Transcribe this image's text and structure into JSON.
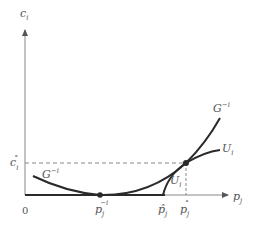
{
  "diagram": {
    "title": "",
    "axes": {
      "y_label": "c",
      "y_label_sub": "i",
      "x_label": "p",
      "x_label_sub": "j",
      "origin_label": "0"
    },
    "curves": [
      {
        "name": "G",
        "sup": "−i",
        "description": "cost curve G^{-i}, U-shaped with minimum at p_j^{-i}"
      },
      {
        "name": "U",
        "sub": "i",
        "description": "curve U_i rising from p-hat_j, crossing G^{-i} at (p_j°, c_i°)"
      }
    ],
    "labels": {
      "g_left": {
        "base": "G",
        "sup": "−i"
      },
      "g_right": {
        "base": "G",
        "sup": "−i"
      },
      "u_right": {
        "base": "U",
        "sub": "i"
      },
      "u_lower": {
        "base": "U",
        "sub": "i"
      },
      "c_star": {
        "base": "c",
        "sub": "i",
        "sup": "°"
      },
      "p_min": {
        "base": "p",
        "sub": "j",
        "sup": "−i"
      },
      "p_hat": {
        "base": "p̂",
        "sub": "j"
      },
      "p_star": {
        "base": "p",
        "sub": "j",
        "sup": "°"
      }
    },
    "points": [
      {
        "name": "minimum",
        "label": "p_j^{-i}"
      },
      {
        "name": "intersection",
        "label": "(p_j°, c_i°)"
      }
    ],
    "colors": {
      "curve": "#2a2a2a",
      "axis": "#888888",
      "dashed": "#888888",
      "label": "#555555"
    }
  }
}
